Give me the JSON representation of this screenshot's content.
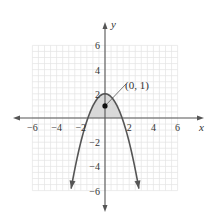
{
  "chart_data": {
    "type": "line",
    "title": "",
    "xlabel": "x",
    "ylabel": "y",
    "xlim": [
      -7,
      8
    ],
    "ylim": [
      -7.5,
      8
    ],
    "grid": true,
    "grid_range": {
      "x": [
        -6,
        6
      ],
      "y": [
        -6,
        6
      ]
    },
    "x_ticks": [
      -6,
      -4,
      -2,
      2,
      4,
      6
    ],
    "x_tick_labels": [
      "−6",
      "−4",
      "−2",
      "2",
      "4",
      "6"
    ],
    "y_ticks": [
      6,
      4,
      2,
      -2,
      -4,
      -6
    ],
    "y_tick_labels": [
      "6",
      "4",
      "2",
      "−2",
      "−4",
      "−6"
    ],
    "series": [
      {
        "name": "parabola",
        "equation": "y = 2 - x^2",
        "x": [
          -2.8,
          -2.4,
          -2,
          -1.6,
          -1.2,
          -0.8,
          -0.4,
          0,
          0.4,
          0.8,
          1.2,
          1.6,
          2,
          2.4,
          2.8
        ],
        "y": [
          -5.84,
          -3.76,
          -2,
          -0.56,
          0.56,
          1.36,
          1.84,
          2,
          1.84,
          1.36,
          0.56,
          -0.56,
          -2,
          -3.76,
          -5.84
        ],
        "arrows_at_ends": true
      }
    ],
    "shaded_region": {
      "description": "region under parabola and above x-axis",
      "x_range": [
        -1.414,
        1.414
      ],
      "color": "#d9d9d9"
    },
    "points": [
      {
        "x": 0,
        "y": 1,
        "label": "(0, 1)"
      }
    ],
    "annotations": [
      {
        "text": "(0, 1)",
        "points_to": [
          0,
          1
        ]
      }
    ]
  },
  "colors": {
    "axis": "#555555",
    "curve": "#555555",
    "grid": "#e4e4e4",
    "shade": "#d9d9d9",
    "text": "#333333",
    "point": "#111111"
  }
}
